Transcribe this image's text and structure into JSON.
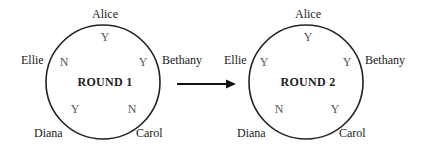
{
  "rounds": [
    {
      "title": "ROUND 1",
      "names": {
        "top": "Alice",
        "right": "Bethany",
        "bottom_right": "Carol",
        "bottom_left": "Diana",
        "left": "Ellie"
      },
      "votes": {
        "Alice": "Y",
        "Bethany": "Y",
        "Carol": "N",
        "Diana": "Y",
        "Ellie": "N"
      }
    },
    {
      "title": "ROUND 2",
      "names": {
        "top": "Alice",
        "right": "Bethany",
        "bottom_right": "Carol",
        "bottom_left": "Diana",
        "left": "Ellie"
      },
      "votes": {
        "Alice": "Y",
        "Bethany": "Y",
        "Carol": "Y",
        "Diana": "N",
        "Ellie": "Y"
      }
    }
  ],
  "arrow": {
    "direction": "right",
    "from": "ROUND 1",
    "to": "ROUND 2"
  }
}
